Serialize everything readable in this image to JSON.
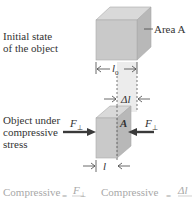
{
  "initial": {
    "label_line1": "Initial state",
    "label_line2": "of the object",
    "area_label": "Area A",
    "length_label": "l",
    "length_sub": "0"
  },
  "compressed": {
    "label_line1": "Object under",
    "label_line2": "compressive",
    "label_line3": "stress",
    "force_left": "F",
    "force_right": "F",
    "perp": "⊥",
    "area_label": "A",
    "delta_label": "Δl",
    "length_label": "l"
  },
  "formulas": {
    "stress_word": "Compressive",
    "stress_rhs_num": "F",
    "stress_perp": "⊥",
    "eq": "=",
    "strain_word": "Compressive",
    "strain_rhs_num": "Δl"
  },
  "colors": {
    "cube_front": "#c8c8c8",
    "cube_top": "#d8d8d8",
    "cube_side": "#b4b4b4",
    "arrow": "#3a3a3a",
    "band": "#e6e6e6"
  }
}
